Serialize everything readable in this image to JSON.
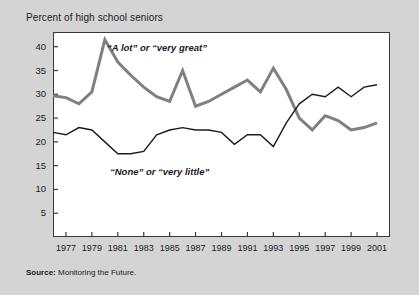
{
  "chart_data": {
    "type": "line",
    "title": "Percent of high school seniors",
    "xlabel": "",
    "ylabel": "Percent of high school seniors",
    "xlim": [
      1976,
      2002
    ],
    "ylim": [
      0,
      43
    ],
    "yticks": [
      5,
      10,
      15,
      20,
      25,
      30,
      35,
      40
    ],
    "xticks": [
      1977,
      1979,
      1981,
      1983,
      1985,
      1987,
      1989,
      1991,
      1993,
      1995,
      1997,
      1999,
      2001
    ],
    "grid": false,
    "legend_position": "inline-annotation",
    "x": [
      1976,
      1977,
      1978,
      1979,
      1980,
      1981,
      1982,
      1983,
      1984,
      1985,
      1986,
      1987,
      1988,
      1989,
      1990,
      1991,
      1992,
      1993,
      1994,
      1995,
      1996,
      1997,
      1998,
      1999,
      2000,
      2001
    ],
    "series": [
      {
        "name": "“A lot” or “very great”",
        "color": "#808080",
        "width": 3.0,
        "values": [
          29.7,
          29.3,
          28.0,
          30.5,
          41.5,
          36.8,
          34.0,
          31.5,
          29.5,
          28.5,
          35.0,
          27.5,
          28.5,
          30.0,
          31.5,
          33.0,
          30.5,
          35.5,
          31.0,
          25.0,
          22.5,
          25.5,
          24.5,
          22.5,
          23.0,
          24.0
        ]
      },
      {
        "name": "“None” or “very little”",
        "color": "#1b1b1b",
        "width": 1.4,
        "values": [
          22.0,
          21.5,
          23.0,
          22.5,
          20.0,
          17.5,
          17.5,
          18.0,
          21.5,
          22.5,
          23.0,
          22.5,
          22.5,
          22.0,
          19.5,
          21.5,
          21.5,
          19.0,
          24.0,
          28.0,
          30.0,
          29.5,
          31.5,
          29.5,
          31.5,
          32.0
        ]
      }
    ],
    "annotations": [
      {
        "name": "a-lot-label",
        "text": "“A lot” or “very great”"
      },
      {
        "name": "none-label",
        "text": "“None” or “very little”"
      }
    ]
  },
  "source": {
    "label": "Source:",
    "text": "Monitoring the Future."
  }
}
